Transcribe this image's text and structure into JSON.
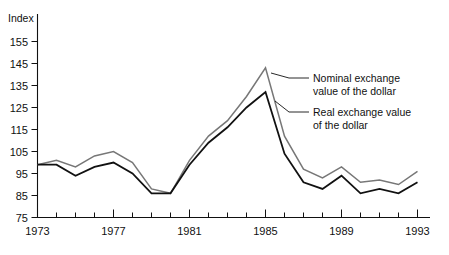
{
  "chart_data": {
    "type": "line",
    "title": "",
    "subtitle": "",
    "ylabel": "Index",
    "xlabel": "",
    "ylim": [
      75,
      160
    ],
    "xlim": [
      1973,
      1993
    ],
    "yticks": [
      75,
      85,
      95,
      105,
      115,
      125,
      135,
      145,
      155
    ],
    "ytick_labels": [
      "75",
      "85",
      "95",
      "105",
      "115",
      "125",
      "135",
      "145",
      "155"
    ],
    "xticks": [
      1973,
      1977,
      1981,
      1985,
      1989,
      1993
    ],
    "xtick_labels": [
      "1973",
      "1977",
      "1981",
      "1985",
      "1989",
      "1993"
    ],
    "minor_xticks_every": 1,
    "grid": false,
    "legend_position": "inline-annotation",
    "x": [
      1973,
      1974,
      1975,
      1976,
      1977,
      1978,
      1979,
      1980,
      1981,
      1982,
      1983,
      1984,
      1985,
      1986,
      1987,
      1988,
      1989,
      1990,
      1991,
      1992,
      1993
    ],
    "series": [
      {
        "name": "Nominal exchange value of the dollar",
        "color": "#777777",
        "values": [
          99,
          101,
          98,
          103,
          105,
          100,
          88,
          86,
          101,
          112,
          119,
          130,
          143,
          112,
          97,
          93,
          98,
          91,
          92,
          90,
          96
        ]
      },
      {
        "name": "Real exchange value of the dollar",
        "color": "#111111",
        "values": [
          99,
          99,
          94,
          98,
          100,
          95,
          86,
          86,
          99,
          109,
          116,
          125,
          132,
          104,
          91,
          88,
          94,
          86,
          88,
          86,
          91
        ]
      }
    ],
    "annotations": [
      {
        "id": "nominal",
        "text_line1": "Nominal exchange",
        "text_line2": "value of the dollar"
      },
      {
        "id": "real",
        "text_line1": "Real exchange value",
        "text_line2": "of the dollar"
      }
    ]
  }
}
